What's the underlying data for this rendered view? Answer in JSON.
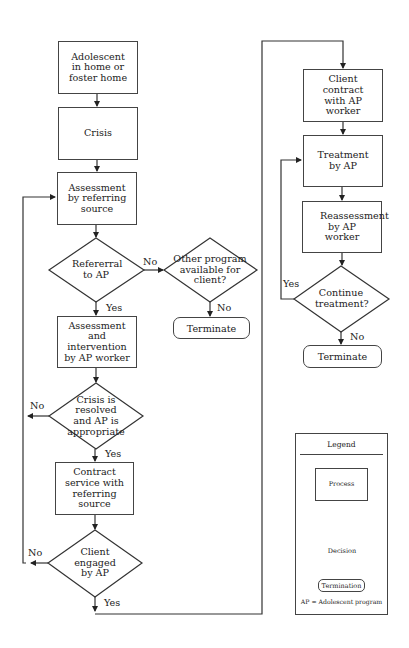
{
  "flowchart": {
    "left_column": {
      "start_box": "Adolescent in home or foster home",
      "crisis_box": "Crisis",
      "assessment_box": "Assessment by referring source",
      "referral_decision": "Refererral to AP",
      "other_program_decision": "Other program available for client?",
      "terminate_1": "Terminate",
      "intervention_box": "Assessment and intervention by AP worker",
      "crisis_resolved_decision": "Crisis is resolved and AP is appropriate",
      "contract_service_box": "Contract service with referring source",
      "client_engaged_decision": "Client engaged by AP"
    },
    "right_column": {
      "client_contract_box": "Client contract with AP worker",
      "treatment_box": "Treatment by AP",
      "reassessment_box": "Reassessment by AP worker",
      "continue_decision": "Continue treatment?",
      "terminate_2": "Terminate"
    },
    "edge_labels": {
      "referral_no": "No",
      "referral_yes": "Yes",
      "other_program_no": "No",
      "crisis_no": "No",
      "crisis_yes": "Yes",
      "engaged_no": "No",
      "engaged_yes": "Yes",
      "continue_yes": "Yes",
      "continue_no": "No"
    }
  },
  "legend": {
    "title": "Legend",
    "process": "Process",
    "decision": "Decision",
    "termination": "Termination",
    "note": "AP = Adolescent program"
  },
  "colors": {
    "line": "#333333",
    "background": "#ffffff"
  }
}
